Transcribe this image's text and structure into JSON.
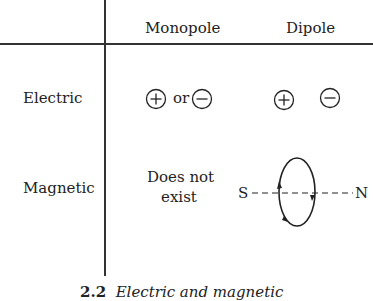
{
  "table": {
    "column_headers": [
      "Monopole",
      "Dipole"
    ],
    "rows": [
      {
        "label": "Electric",
        "monopole": {
          "text": "or",
          "symbols": [
            "plus-charge",
            "minus-charge"
          ]
        },
        "dipole": {
          "symbols": [
            "plus-charge",
            "minus-charge"
          ]
        }
      },
      {
        "label": "Magnetic",
        "monopole": {
          "line1": "Does not",
          "line2": "exist"
        },
        "dipole": {
          "left_pole": "S",
          "right_pole": "N"
        }
      }
    ]
  },
  "caption": {
    "number": "2.2",
    "text": "Electric and magnetic"
  }
}
